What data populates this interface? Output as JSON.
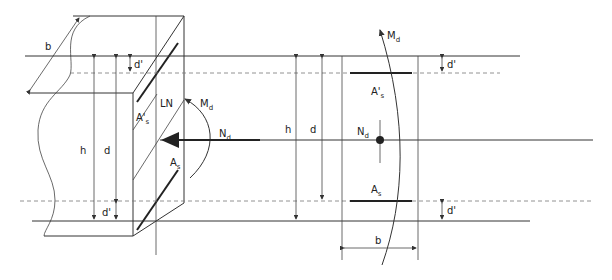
{
  "diagram": {
    "type": "reinforced-concrete-section",
    "labels": {
      "width": "b",
      "height": "h",
      "effective_depth": "d",
      "cover_top": "d'",
      "cover_bottom": "d'",
      "neutral_line": "LN",
      "moment": "M",
      "moment_sub": "d",
      "normal_force": "N",
      "normal_force_sub": "d",
      "top_steel": "A's",
      "top_steel_main": "A'",
      "top_steel_sub": "s",
      "bottom_steel_main": "A",
      "bottom_steel_sub": "s"
    },
    "colors": {
      "line": "#333333",
      "dashed": "#777777",
      "background": "#ffffff"
    }
  }
}
